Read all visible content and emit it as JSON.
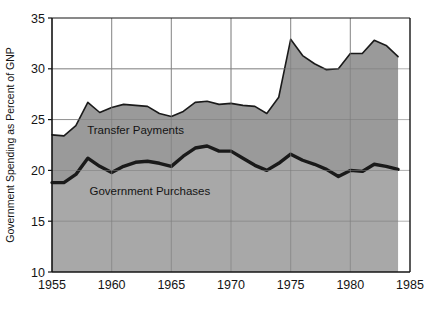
{
  "chart_data": {
    "type": "area",
    "title": "",
    "subtitle": "",
    "xlabel": "",
    "ylabel": "Government Spending as Percent of GNP",
    "xlim": [
      1955,
      1985
    ],
    "ylim": [
      10,
      35
    ],
    "grid": true,
    "legend_position": "inline-annotations",
    "xticks": [
      "1955",
      "1960",
      "1965",
      "1970",
      "1975",
      "1980",
      "1985"
    ],
    "xtick_values": [
      1955,
      1960,
      1965,
      1970,
      1975,
      1980,
      1985
    ],
    "yticks": [
      "10",
      "15",
      "20",
      "25",
      "30",
      "35"
    ],
    "ytick_values": [
      10,
      15,
      20,
      25,
      30,
      35
    ],
    "x": [
      1955,
      1956,
      1957,
      1958,
      1959,
      1960,
      1961,
      1962,
      1963,
      1964,
      1965,
      1966,
      1967,
      1968,
      1969,
      1970,
      1971,
      1972,
      1973,
      1974,
      1975,
      1976,
      1977,
      1978,
      1979,
      1980,
      1981,
      1982,
      1983,
      1984
    ],
    "series": [
      {
        "name": "Government Purchases",
        "color": "#1a1a1a",
        "fill": "#a8a8a8",
        "label": "Government Purchases",
        "label_x": 1963.2,
        "label_y": 17.6,
        "values": [
          18.8,
          18.8,
          19.6,
          21.2,
          20.4,
          19.8,
          20.4,
          20.8,
          20.9,
          20.7,
          20.4,
          21.4,
          22.2,
          22.4,
          21.9,
          21.9,
          21.2,
          20.5,
          20.0,
          20.7,
          21.6,
          21.0,
          20.6,
          20.1,
          19.4,
          20.0,
          19.9,
          20.6,
          20.4,
          20.1
        ]
      },
      {
        "name": "Transfer Payments",
        "color": "#1a1a1a",
        "fill": "#9a9a9a",
        "label": "Transfer Payments",
        "label_x": 1962.0,
        "label_y": 23.6,
        "values": [
          23.5,
          23.4,
          24.4,
          26.7,
          25.7,
          26.2,
          26.5,
          26.4,
          26.3,
          25.6,
          25.3,
          25.8,
          26.7,
          26.8,
          26.5,
          26.6,
          26.4,
          26.3,
          25.6,
          27.2,
          32.9,
          31.3,
          30.5,
          29.9,
          30.0,
          31.5,
          31.5,
          32.8,
          32.3,
          31.2
        ]
      }
    ]
  },
  "axes": {
    "ylabel": "Government Spending as Percent of GNP"
  }
}
